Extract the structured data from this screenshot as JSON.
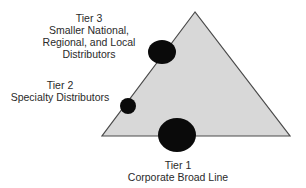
{
  "diagram": {
    "triangle": {
      "fill": "#d8d8d8",
      "stroke": "#4a4a4a",
      "points": [
        [
          195,
          12
        ],
        [
          102,
          136
        ],
        [
          290,
          136
        ]
      ]
    },
    "tiers": [
      {
        "id": "tier1",
        "title": "Tier 1",
        "lines": [
          "Corporate Broad Line"
        ],
        "marker": {
          "cx": 177,
          "cy": 135,
          "rx": 19,
          "ry": 17,
          "color": "#0a0a0a"
        }
      },
      {
        "id": "tier2",
        "title": "Tier 2",
        "lines": [
          "Specialty Distributors"
        ],
        "marker": {
          "cx": 128,
          "cy": 106,
          "rx": 8,
          "ry": 8,
          "color": "#0a0a0a"
        }
      },
      {
        "id": "tier3",
        "title": "Tier 3",
        "lines": [
          "Smaller National,",
          "Regional, and Local",
          "Distributors"
        ],
        "marker": {
          "cx": 162,
          "cy": 52,
          "rx": 14,
          "ry": 12,
          "color": "#0a0a0a"
        }
      }
    ]
  }
}
